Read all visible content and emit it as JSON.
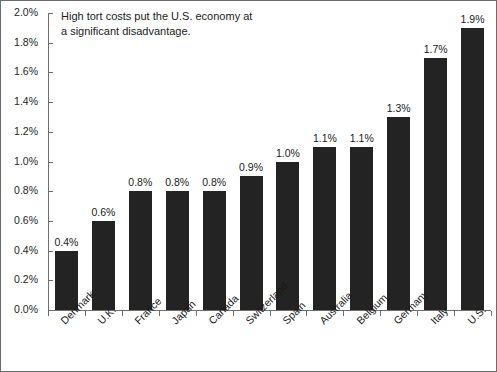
{
  "annotation": {
    "line1": "High tort costs put the U.S. economy at",
    "line2": "a significant disadvantage."
  },
  "chart_data": {
    "type": "bar",
    "title": "High tort costs put the U.S. economy at a significant disadvantage.",
    "xlabel": "",
    "ylabel": "",
    "ylim": [
      0.0,
      2.0
    ],
    "ytick_labels": [
      "0.0%",
      "0.2%",
      "0.4%",
      "0.6%",
      "0.8%",
      "1.0%",
      "1.2%",
      "1.4%",
      "1.6%",
      "1.8%",
      "2.0%"
    ],
    "ytick_values": [
      0.0,
      0.2,
      0.4,
      0.6,
      0.8,
      1.0,
      1.2,
      1.4,
      1.6,
      1.8,
      2.0
    ],
    "grid": false,
    "legend": "none",
    "bar_color": "#232323",
    "categories": [
      "Denmark",
      "U.K.",
      "France",
      "Japan",
      "Canada",
      "Switzerland",
      "Spain",
      "Australia",
      "Belgium",
      "Germany",
      "Italy",
      "U.S."
    ],
    "values": [
      0.4,
      0.6,
      0.8,
      0.8,
      0.8,
      0.9,
      1.0,
      1.1,
      1.1,
      1.3,
      1.7,
      1.9
    ],
    "data_labels": [
      "0.4%",
      "0.6%",
      "0.8%",
      "0.8%",
      "0.8%",
      "0.9%",
      "1.0%",
      "1.1%",
      "1.1%",
      "1.3%",
      "1.7%",
      "1.9%"
    ]
  }
}
